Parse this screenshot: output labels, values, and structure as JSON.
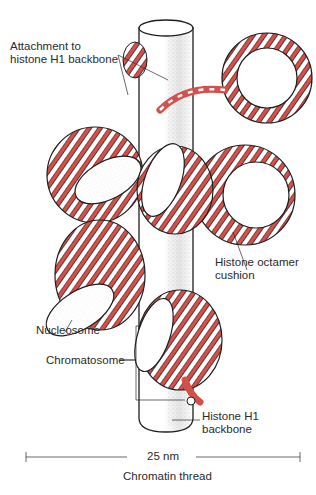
{
  "colors": {
    "dna_red": "#d4504b",
    "dna_white": "#ffffff",
    "outline": "#1e1e1e",
    "stipple": "#b8b8b8",
    "label_text": "#2a2a2a"
  },
  "labels": {
    "attachment": "Attachment to\nhistone H1 backbone",
    "histone_octamer": "Histone octamer\ncushion",
    "nucleosome": "Nucleosome",
    "chromatosome": "Chromatosome",
    "histone_h1": "Histone H1\nbackbone",
    "scale": "25 nm",
    "title": "Chromatin thread"
  }
}
